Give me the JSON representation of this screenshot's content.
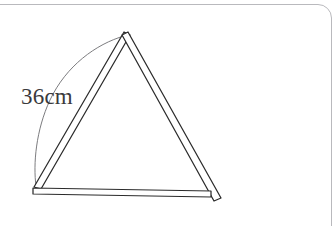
{
  "figure": {
    "background_color": "#ffffff",
    "frame": {
      "border_color": "#b9b9bd",
      "corner_radius_px": 14
    },
    "annotation": {
      "measurement_label": "36cm",
      "label_color": "#3a3a3c",
      "leader_line_color": "#6d6d70"
    },
    "ink_color": "#2b2b2b",
    "shape": {
      "type": "triangle",
      "rod_count": 3,
      "vertices": {
        "apex": [
          128,
          33
        ],
        "bottom_left": [
          37,
          188
        ],
        "bottom_right": [
          212,
          193
        ]
      },
      "rods": [
        {
          "name": "left-rod",
          "from": [
            37,
            188
          ],
          "to": [
            128,
            33
          ]
        },
        {
          "name": "right-rod",
          "from": [
            132,
            35
          ],
          "to": [
            218,
            200
          ]
        },
        {
          "name": "base-rod",
          "from": [
            34,
            191
          ],
          "to": [
            211,
            195
          ]
        }
      ]
    }
  }
}
